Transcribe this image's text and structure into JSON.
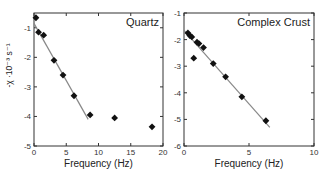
{
  "chart_data": [
    {
      "type": "scatter",
      "title": "Quartz",
      "xlabel": "Frequency (Hz)",
      "ylabel": "-χ ·10⁻³ s⁻¹",
      "xlim": [
        0,
        20
      ],
      "ylim": [
        -5,
        -0.5
      ],
      "xticks": [
        0,
        5,
        10,
        15,
        20
      ],
      "yticks": [
        -1,
        -2,
        -3,
        -4,
        -5
      ],
      "grid": false,
      "legend": "none",
      "series": [
        {
          "name": "Quartz data",
          "marker": "diamond",
          "x": [
            0.3,
            0.7,
            1.5,
            3.1,
            4.5,
            6.2,
            8.7,
            12.5,
            18.3
          ],
          "y": [
            -0.66,
            -1.15,
            -1.25,
            -2.1,
            -2.6,
            -3.3,
            -3.95,
            -4.05,
            -4.35
          ]
        },
        {
          "name": "Linear fit",
          "style": "line",
          "x": [
            0,
            8.4
          ],
          "y": [
            -0.85,
            -4.1
          ]
        }
      ]
    },
    {
      "type": "scatter",
      "title": "Complex Crust",
      "xlabel": "Frequency (Hz)",
      "ylabel": "",
      "xlim": [
        0,
        10
      ],
      "ylim": [
        -6,
        -1
      ],
      "xticks": [
        0,
        5,
        10
      ],
      "yticks": [
        -1,
        -2,
        -3,
        -4,
        -5,
        -6
      ],
      "grid": false,
      "legend": "none",
      "series": [
        {
          "name": "Complex Crust data",
          "marker": "diamond",
          "x": [
            0.3,
            0.45,
            0.6,
            0.75,
            1.0,
            1.15,
            1.5,
            2.25,
            3.2,
            4.45,
            6.3
          ],
          "y": [
            -1.75,
            -1.85,
            -1.9,
            -2.7,
            -2.1,
            -2.15,
            -2.3,
            -2.9,
            -3.4,
            -4.15,
            -5.05
          ]
        },
        {
          "name": "Linear fit",
          "style": "line",
          "x": [
            0,
            6.6
          ],
          "y": [
            -1.65,
            -5.3
          ]
        }
      ]
    }
  ],
  "panels": {
    "left": {
      "title": "Quartz",
      "xlabel": "Frequency (Hz)",
      "ylabel": "-χ ·10⁻³ s⁻¹"
    },
    "right": {
      "title": "Complex Crust",
      "xlabel": "Frequency (Hz)"
    }
  },
  "colors": {
    "marker": "#111111",
    "fit_line": "#888888",
    "axis": "#333333"
  }
}
